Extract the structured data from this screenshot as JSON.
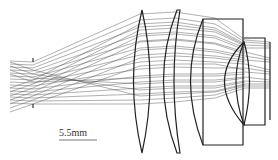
{
  "diagram": {
    "type": "optical-lens-ray-trace",
    "scale_bar": {
      "label": "5.5mm"
    },
    "colors": {
      "rays": "#333333",
      "lens": "#222222",
      "background": "#ffffff"
    }
  }
}
